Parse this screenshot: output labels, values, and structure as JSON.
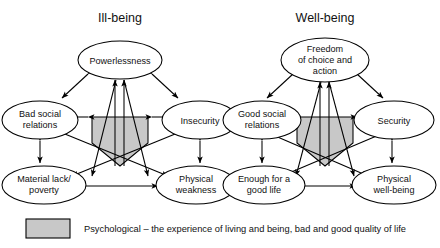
{
  "figure": {
    "background": "#ffffff",
    "node_fill": "#ffffff",
    "stroke": "#000000",
    "psych_fill": "#c8c8c8"
  },
  "panels": [
    {
      "id": "ill-being",
      "title": "Ill-being",
      "nodes": [
        {
          "id": "powerlessness",
          "lines": [
            "Powerlessness"
          ]
        },
        {
          "id": "bad-social-relations",
          "lines": [
            "Bad social",
            "relations"
          ]
        },
        {
          "id": "insecurity",
          "lines": [
            "Insecurity"
          ]
        },
        {
          "id": "material-lack",
          "lines": [
            "Material lack/",
            "poverty"
          ]
        },
        {
          "id": "physical-weakness",
          "lines": [
            "Physical",
            "weakness"
          ]
        }
      ],
      "center": {
        "id": "psychological-ill",
        "label": ""
      }
    },
    {
      "id": "well-being",
      "title": "Well-being",
      "nodes": [
        {
          "id": "freedom",
          "lines": [
            "Freedom",
            "of choice and",
            "action"
          ]
        },
        {
          "id": "good-social-relations",
          "lines": [
            "Good social",
            "relations"
          ]
        },
        {
          "id": "security",
          "lines": [
            "Security"
          ]
        },
        {
          "id": "enough-good-life",
          "lines": [
            "Enough for a",
            "good life"
          ]
        },
        {
          "id": "physical-well-being",
          "lines": [
            "Physical",
            "well-being"
          ]
        }
      ],
      "center": {
        "id": "psychological-well",
        "label": ""
      }
    }
  ],
  "legend": {
    "swatch_color": "#c8c8c8",
    "text": "Psychological – the experience of living and being, bad and good quality of life"
  }
}
